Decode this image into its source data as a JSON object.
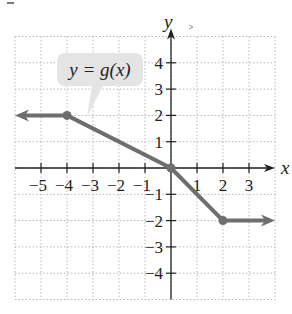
{
  "chart_data": {
    "type": "line",
    "title": "",
    "xlabel": "x",
    "ylabel": "y",
    "xlim": [
      -6,
      4
    ],
    "ylim": [
      -5,
      5
    ],
    "grid": true,
    "grid_style": "dotted",
    "x_ticks": [
      -5,
      -4,
      -3,
      -2,
      -1,
      1,
      2,
      3
    ],
    "y_ticks": [
      -4,
      -3,
      -2,
      -1,
      1,
      2,
      3,
      4
    ],
    "x_tick_labels": [
      "−5",
      "−4",
      "−3",
      "−2",
      "−1",
      "1",
      "2",
      "3"
    ],
    "y_tick_labels": [
      "−4",
      "−3",
      "−2",
      "−1",
      "1",
      "2",
      "3",
      "4"
    ],
    "series": [
      {
        "name": "y = g(x)",
        "x": [
          -6,
          -4,
          0,
          2,
          4
        ],
        "y": [
          2,
          2,
          0,
          -2,
          -2
        ],
        "points_marked": [
          [
            -4,
            2
          ],
          [
            0,
            0
          ],
          [
            2,
            -2
          ]
        ],
        "left_arrow": true,
        "right_arrow": true,
        "color": "#6e6e6e"
      }
    ],
    "annotations": [
      {
        "text": "y = g(x)",
        "type": "callout",
        "points_to": [
          -3.2,
          2
        ]
      }
    ],
    "legend": "none"
  },
  "labels": {
    "x_axis": "x",
    "y_axis": "y",
    "callout": "y = g(x)"
  },
  "colors": {
    "curve": "#6e6e6e",
    "axis": "#222222",
    "grid": "#b8b8b8",
    "callout_bg": "#e4e4e4"
  }
}
